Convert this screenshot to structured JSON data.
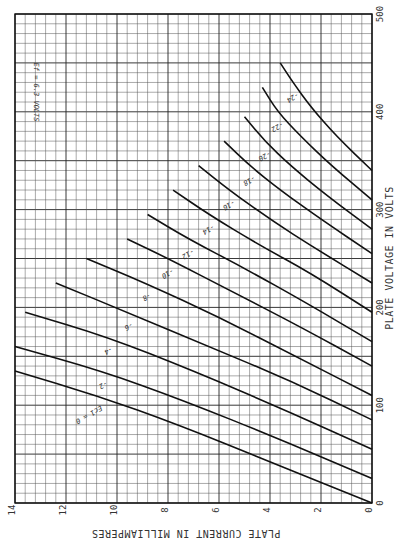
{
  "chart_data": {
    "type": "line",
    "title": "Ef = 6.3 VOLTS",
    "xlabel": "PLATE VOLTAGE IN VOLTS",
    "ylabel": "PLATE CURRENT IN MILLIAMPERES",
    "xlim": [
      0,
      500
    ],
    "ylim": [
      0,
      14
    ],
    "x_ticks": [
      "0",
      "100",
      "200",
      "300",
      "400",
      "500"
    ],
    "y_ticks": [
      "0",
      "2",
      "4",
      "6",
      "8",
      "10",
      "12",
      "14"
    ],
    "grid": true,
    "orientation": "rotated 90deg counter-clockwise on page",
    "legend_prefix": "Ec1 =",
    "series": [
      {
        "name": "Ec1 = 0",
        "label": "0",
        "points": [
          [
            0,
            0
          ],
          [
            40,
            3.8
          ],
          [
            80,
            7.6
          ],
          [
            110,
            10.8
          ],
          [
            135,
            14
          ]
        ]
      },
      {
        "name": "Ec1 = -2",
        "label": "-2",
        "points": [
          [
            25,
            0
          ],
          [
            65,
            3.6
          ],
          [
            105,
            7.4
          ],
          [
            135,
            10.6
          ],
          [
            160,
            14
          ]
        ]
      },
      {
        "name": "Ec1 = -4",
        "label": "-4",
        "points": [
          [
            55,
            0
          ],
          [
            95,
            3.4
          ],
          [
            135,
            7.0
          ],
          [
            170,
            10.4
          ],
          [
            195,
            13.6
          ]
        ]
      },
      {
        "name": "Ec1 = -6",
        "label": "-6",
        "points": [
          [
            85,
            0
          ],
          [
            125,
            3.2
          ],
          [
            160,
            6.4
          ],
          [
            195,
            9.6
          ],
          [
            225,
            12.4
          ]
        ]
      },
      {
        "name": "Ec1 = -8",
        "label": "-8",
        "points": [
          [
            110,
            0
          ],
          [
            150,
            3.0
          ],
          [
            190,
            6.0
          ],
          [
            225,
            8.9
          ],
          [
            250,
            11.2
          ]
        ]
      },
      {
        "name": "Ec1 = -10",
        "label": "-10",
        "points": [
          [
            140,
            0
          ],
          [
            180,
            2.8
          ],
          [
            215,
            5.4
          ],
          [
            250,
            8.0
          ],
          [
            270,
            9.6
          ]
        ]
      },
      {
        "name": "Ec1 = -12",
        "label": "-12",
        "points": [
          [
            165,
            0
          ],
          [
            205,
            2.6
          ],
          [
            240,
            5.0
          ],
          [
            270,
            7.2
          ],
          [
            295,
            8.8
          ]
        ]
      },
      {
        "name": "Ec1 = -14",
        "label": "-14",
        "points": [
          [
            195,
            0
          ],
          [
            235,
            2.4
          ],
          [
            265,
            4.5
          ],
          [
            295,
            6.4
          ],
          [
            320,
            7.8
          ]
        ]
      },
      {
        "name": "Ec1 = -16",
        "label": "-16",
        "points": [
          [
            225,
            0
          ],
          [
            260,
            2.2
          ],
          [
            290,
            4.0
          ],
          [
            320,
            5.6
          ],
          [
            345,
            6.8
          ]
        ]
      },
      {
        "name": "Ec1 = -18",
        "label": "-18",
        "points": [
          [
            255,
            0
          ],
          [
            290,
            2.0
          ],
          [
            320,
            3.6
          ],
          [
            345,
            4.8
          ],
          [
            370,
            5.8
          ]
        ]
      },
      {
        "name": "Ec1 = -20",
        "label": "-20",
        "points": [
          [
            280,
            0
          ],
          [
            315,
            1.8
          ],
          [
            345,
            3.2
          ],
          [
            370,
            4.2
          ],
          [
            395,
            5.0
          ]
        ]
      },
      {
        "name": "Ec1 = -22",
        "label": "-22",
        "points": [
          [
            310,
            0
          ],
          [
            345,
            1.6
          ],
          [
            375,
            2.8
          ],
          [
            400,
            3.7
          ],
          [
            425,
            4.3
          ]
        ]
      },
      {
        "name": "Ec1 = -24",
        "label": "-24",
        "points": [
          [
            340,
            0
          ],
          [
            375,
            1.4
          ],
          [
            405,
            2.4
          ],
          [
            430,
            3.1
          ],
          [
            450,
            3.6
          ]
        ]
      }
    ]
  }
}
